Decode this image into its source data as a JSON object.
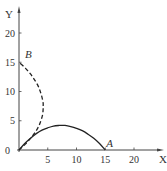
{
  "chart_data": {
    "type": "line",
    "title": "",
    "xlabel": "X",
    "ylabel": "Y",
    "xlim": [
      0,
      25
    ],
    "ylim": [
      0,
      23
    ],
    "x_ticks": [
      "5",
      "10",
      "15",
      "20"
    ],
    "y_ticks": [
      "5",
      "10",
      "15",
      "20"
    ],
    "origin_label": "0",
    "grid": false,
    "legend": null,
    "series": [
      {
        "name": "trajectory-A",
        "style": "solid",
        "end_label": "A",
        "x": [
          0,
          1,
          2,
          3,
          4,
          5,
          6,
          7,
          7.5,
          8,
          9,
          10,
          11,
          12,
          13,
          14,
          15
        ],
        "y": [
          0,
          1.1,
          2.0,
          2.8,
          3.4,
          3.8,
          4.1,
          4.2,
          4.2,
          4.2,
          4.0,
          3.7,
          3.3,
          2.7,
          2.0,
          1.1,
          0
        ]
      },
      {
        "name": "trajectory-B",
        "style": "dashed",
        "end_label": "B",
        "x": [
          0,
          1.1,
          2.0,
          2.8,
          3.4,
          3.8,
          4.1,
          4.2,
          4.2,
          4.2,
          4.0,
          3.7,
          3.3,
          2.7,
          2.0,
          1.1,
          0
        ],
        "y": [
          0,
          1,
          2,
          3,
          4,
          5,
          6,
          7,
          7.5,
          8,
          9,
          10,
          11,
          12,
          13,
          14,
          15
        ]
      }
    ],
    "annotations": [
      {
        "text": "A",
        "x": 15,
        "y": 0
      },
      {
        "text": "B",
        "x": 0,
        "y": 15
      }
    ]
  }
}
